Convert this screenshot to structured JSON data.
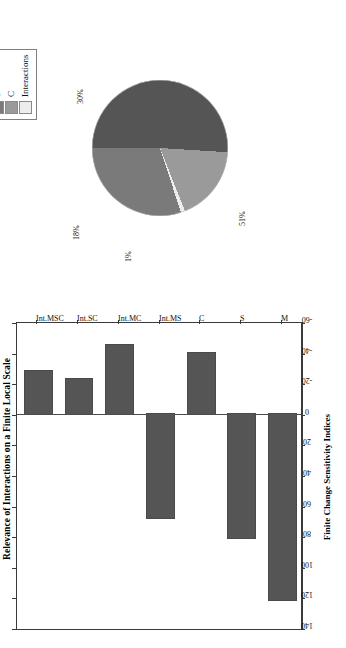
{
  "figure": {
    "title": "Relevance of Interactions on a Finite Local Scale"
  },
  "bar_axis": {
    "value_axis_title": "Finite Change Sensitivity Indices"
  },
  "legend": {
    "items": [
      {
        "label": "M",
        "color": "#555555"
      },
      {
        "label": "S",
        "color": "#7a7a7a"
      },
      {
        "label": "C",
        "color": "#9a9a9a"
      },
      {
        "label": "Interactions",
        "color": "#ededed"
      }
    ]
  },
  "pie_labels": {
    "m": "51%",
    "interactions": "1%",
    "c": "18%",
    "s": "30%"
  },
  "chart_data": [
    {
      "type": "bar",
      "title": "Relevance of Interactions on a Finite Local Scale",
      "xlabel": "",
      "ylabel": "Finite Change Sensitivity Indices",
      "orientation": "vertical",
      "categories": [
        "M",
        "S",
        "C",
        "Int.MS",
        "Int.MC",
        "Int.SC",
        "Int.MSC"
      ],
      "values": [
        122,
        81,
        -40,
        68,
        -45,
        -23,
        -28
      ],
      "ylim": [
        -60,
        140
      ],
      "yticks": [
        140,
        120,
        100,
        80,
        60,
        40,
        20,
        0,
        -20,
        -40,
        -60
      ],
      "ytick_labels": [
        "140",
        "120",
        "100",
        "80",
        "60",
        "40",
        "20",
        "0",
        "-20",
        "-40",
        "-60"
      ],
      "grid": false,
      "bar_color": "#555555",
      "legend": "none"
    },
    {
      "type": "pie",
      "title": "",
      "labels": [
        "M",
        "S",
        "C",
        "Interactions"
      ],
      "values": [
        51,
        30,
        18,
        1
      ],
      "value_labels": [
        "51%",
        "30%",
        "18%",
        "1%"
      ],
      "colors": [
        "#555555",
        "#7a7a7a",
        "#9a9a9a",
        "#ededed"
      ],
      "legend": "top-right",
      "legend_entries": [
        "M",
        "S",
        "C",
        "Interactions"
      ]
    }
  ]
}
